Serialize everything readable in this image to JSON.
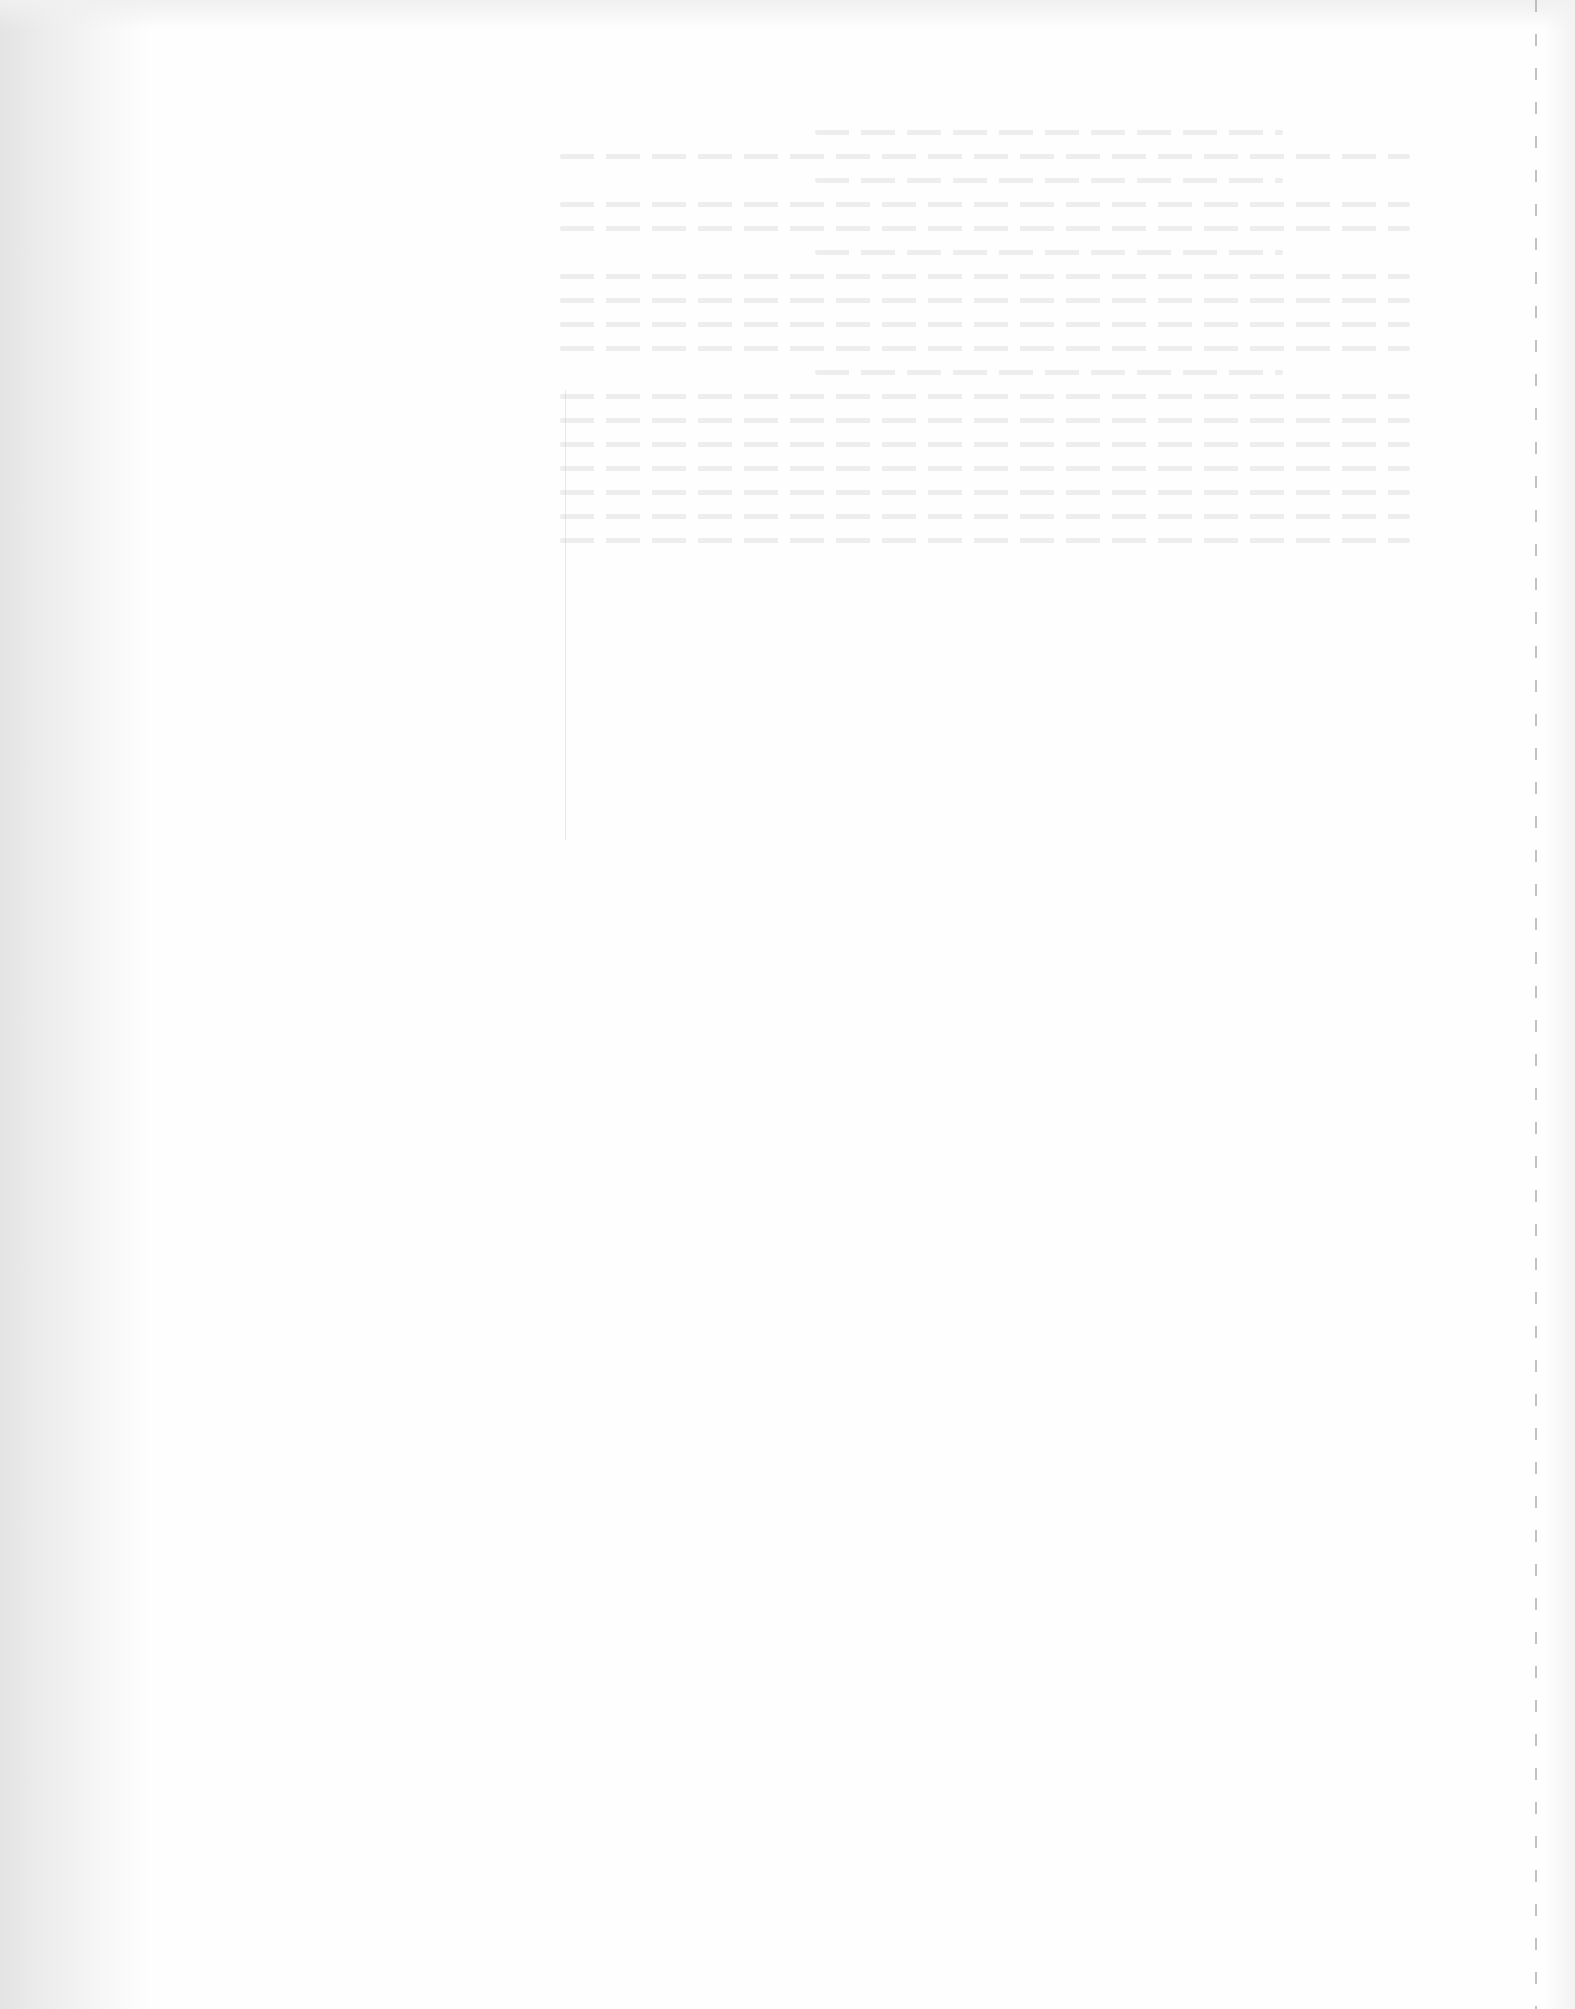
{
  "page": {
    "type": "blank scanned page",
    "legible_text": "",
    "background_color": "#fefefe",
    "features": [
      "scanner-edge-shadow-left",
      "illegible-bleed-through-text",
      "faint-vertical-rule",
      "dashed-perforation-line-right"
    ]
  }
}
